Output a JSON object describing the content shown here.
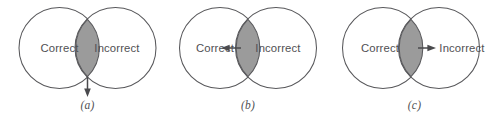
{
  "figure": {
    "background_color": "#ffffff",
    "stroke_color": "#58585b",
    "lens_fill_color": "#9b9b9b",
    "text_color": "#4f4f53",
    "arrow_color": "#4a4a4d"
  },
  "panels": [
    {
      "id": "a",
      "caption": "(a)",
      "left_circle_label": "Correct",
      "right_circle_label": "Incorrect",
      "arrow": {
        "direction": "down",
        "points_to": "below-intersection",
        "icon": "arrow-down-icon"
      }
    },
    {
      "id": "b",
      "caption": "(b)",
      "left_circle_label": "Correct",
      "right_circle_label": "Incorrect",
      "arrow": {
        "direction": "left",
        "points_to": "Correct",
        "icon": "arrow-left-icon"
      }
    },
    {
      "id": "c",
      "caption": "(c)",
      "left_circle_label": "Correct",
      "right_circle_label": "Incorrect",
      "arrow": {
        "direction": "right",
        "points_to": "Incorrect",
        "icon": "arrow-right-icon"
      }
    }
  ]
}
